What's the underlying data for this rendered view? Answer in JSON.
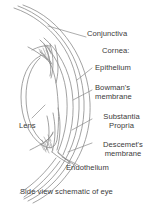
{
  "figure": {
    "caption": "Side view schematic of eye",
    "ink_color": "#3a3a3a",
    "stroke_color": "#8a8a8a",
    "background": "#ffffff"
  },
  "labels": {
    "conjunctiva": "Conjunctiva",
    "cornea_group": "Cornea:",
    "epithelium": "Epithelium",
    "bowmans_membrane": "Bowman's\nmembrane",
    "substantia_propria": "Substantia\nPropria",
    "descemets_membrane": "Descemet's\nmembrane",
    "endothelium": "Endothelium",
    "lens": "Lens"
  }
}
